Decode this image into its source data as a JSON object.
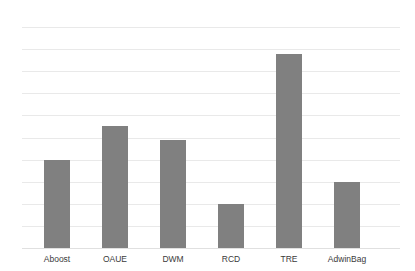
{
  "chart_data": {
    "type": "bar",
    "title": "",
    "subtitle": "",
    "xlabel": "",
    "ylabel": "",
    "categories": [
      "Aboost",
      "OAUE",
      "DWM",
      "RCD",
      "TRE",
      "AdwinBag"
    ],
    "values": [
      4.0,
      5.5,
      4.9,
      2.0,
      8.8,
      3.0
    ],
    "series": [
      {
        "name": "",
        "values": [
          4.0,
          5.5,
          4.9,
          2.0,
          8.8,
          3.0
        ],
        "color": "#808080"
      }
    ],
    "ylim": [
      0,
      10
    ],
    "yticks": [
      0,
      1,
      2,
      3,
      4,
      5,
      6,
      7,
      8,
      9,
      10
    ],
    "ytick_labels": [
      "0",
      "1",
      "2",
      "3",
      "4",
      "5",
      "6",
      "7",
      "8",
      "9",
      "10"
    ],
    "grid": {
      "horizontal": true,
      "vertical": false,
      "color": "#e9e9e9"
    },
    "legend": {
      "visible": false,
      "position": "none",
      "entries": []
    },
    "annotations": [],
    "background_color": "#ffffff",
    "bar_color": "#808080",
    "axis_label_color": "#3a3a3a",
    "tick_label_color": "#6e6e6e"
  }
}
